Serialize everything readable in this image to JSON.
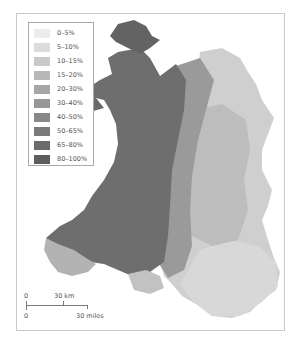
{
  "legend": {
    "items": [
      {
        "label": "0–5%",
        "color": "#ececec"
      },
      {
        "label": "5–10%",
        "color": "#dcdcdc"
      },
      {
        "label": "10–15%",
        "color": "#c9c9c9"
      },
      {
        "label": "15–20%",
        "color": "#b8b8b8"
      },
      {
        "label": "20–30%",
        "color": "#a6a6a6"
      },
      {
        "label": "30–40%",
        "color": "#979797"
      },
      {
        "label": "40–50%",
        "color": "#888888"
      },
      {
        "label": "50–65%",
        "color": "#7a7a7a"
      },
      {
        "label": "65–80%",
        "color": "#6b6b6b"
      },
      {
        "label": "80–100%",
        "color": "#5e5e5e"
      }
    ]
  },
  "scale_bar": {
    "km_zero": "0",
    "km_label": "30 km",
    "miles_zero": "0",
    "miles_label": "30 miles"
  },
  "map": {
    "region": "Wales",
    "type": "grayscale choropleth by percentage band",
    "pattern": "darkest (80–100%) in north-west and west (Anglesey, Gwynedd, Ceredigion, Carmarthenshire); lightest (0–15%) in east and south-east border areas and south Pembrokeshire"
  }
}
